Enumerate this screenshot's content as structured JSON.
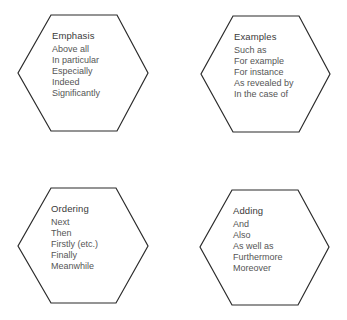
{
  "diagram": {
    "type": "hexagon-groups",
    "stroke_color": "#2b2b2b",
    "groups": [
      {
        "title": "Emphasis",
        "items": [
          "Above all",
          "In particular",
          "Especially",
          "Indeed",
          "Significantly"
        ]
      },
      {
        "title": "Examples",
        "items": [
          "Such as",
          "For example",
          "For instance",
          "As revealed by",
          "In the case of"
        ]
      },
      {
        "title": "Ordering",
        "items": [
          "Next",
          "Then",
          "Firstly (etc.)",
          "Finally",
          "Meanwhile"
        ]
      },
      {
        "title": "Adding",
        "items": [
          "And",
          "Also",
          "As well as",
          "Furthermore",
          "Moreover"
        ]
      }
    ]
  }
}
